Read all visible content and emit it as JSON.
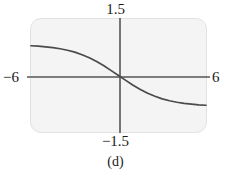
{
  "figure": {
    "caption": "(d)",
    "panel_bg": "#f4f4f4",
    "axis_color": "#555555",
    "curve_color": "#4a4a4a"
  },
  "labels": {
    "y_max": "1.5",
    "y_min": "−1.5",
    "x_min": "−6",
    "x_max": "6"
  },
  "chart_data": {
    "type": "line",
    "title": "",
    "subtitle": "",
    "xlabel": "",
    "ylabel": "",
    "xlim": [
      -6,
      6
    ],
    "ylim": [
      -1.5,
      1.5
    ],
    "grid": false,
    "legend": null,
    "xticks": [
      -6,
      6
    ],
    "xticklabels": [
      "−6",
      "6"
    ],
    "yticks": [
      -1.5,
      1.5
    ],
    "yticklabels": [
      "−1.5",
      "1.5"
    ],
    "annotations": [
      "(d)"
    ],
    "series": [
      {
        "name": "curve",
        "color": "#4a4a4a",
        "x": [
          -6.0,
          -5.5,
          -5.0,
          -4.5,
          -4.0,
          -3.5,
          -3.0,
          -2.5,
          -2.0,
          -1.5,
          -1.0,
          -0.5,
          0.0,
          0.5,
          1.0,
          1.5,
          2.0,
          2.5,
          3.0,
          3.5,
          4.0,
          4.5,
          5.0,
          5.5,
          6.0
        ],
        "y": [
          0.79,
          0.78,
          0.76,
          0.74,
          0.71,
          0.67,
          0.62,
          0.55,
          0.47,
          0.37,
          0.26,
          0.13,
          0.0,
          -0.13,
          -0.26,
          -0.37,
          -0.47,
          -0.55,
          -0.62,
          -0.67,
          -0.71,
          -0.74,
          -0.76,
          -0.78,
          -0.79
        ]
      }
    ]
  }
}
